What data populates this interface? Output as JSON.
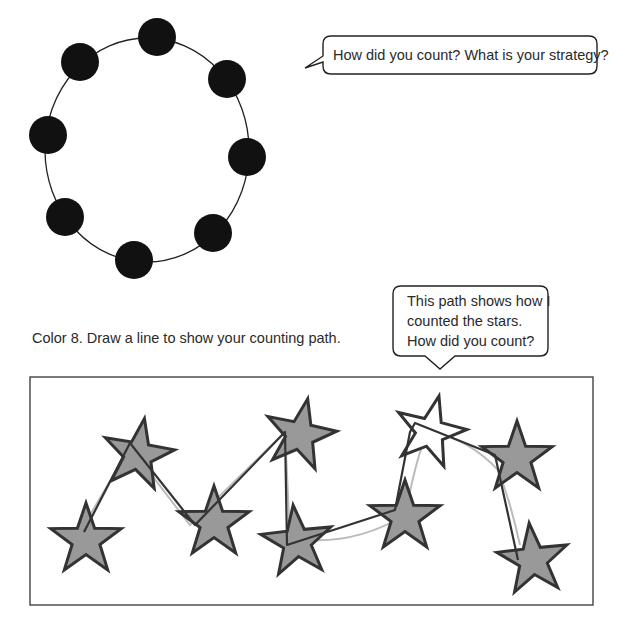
{
  "worksheet": {
    "circle_section": {
      "dot_count": 8,
      "dot_color": "#111111",
      "ring_color": "#222222",
      "ring": {
        "cx": 147,
        "cy": 148,
        "rx": 102,
        "ry": 114
      },
      "dots": [
        {
          "x": 157,
          "y": 37
        },
        {
          "x": 227,
          "y": 79
        },
        {
          "x": 247,
          "y": 157
        },
        {
          "x": 213,
          "y": 233
        },
        {
          "x": 134,
          "y": 260
        },
        {
          "x": 65,
          "y": 217
        },
        {
          "x": 48,
          "y": 135
        },
        {
          "x": 80,
          "y": 62
        }
      ],
      "prompt_bubble": {
        "text": "How did you count?  What is your strategy?"
      }
    },
    "stars_section": {
      "instruction": "Color 8.  Draw a line to show your counting path.",
      "prompt_bubble": {
        "line1": "This path shows how I",
        "line2": "counted the stars.",
        "line3": "How did you count?"
      },
      "star_fill": "#999999",
      "star_stroke": "#333333",
      "uncolored_star_fill": "#ffffff",
      "stars_total": 9,
      "stars_colored": 8
    }
  }
}
